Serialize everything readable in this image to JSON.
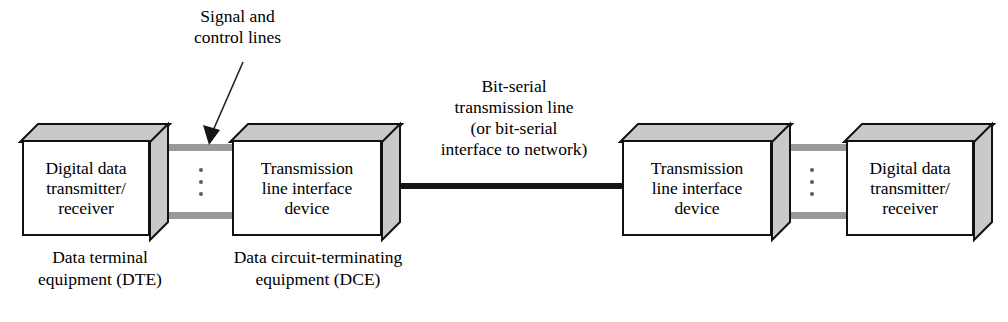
{
  "diagram": {
    "colors": {
      "box_face": "#ffffff",
      "box_shade": "#c9c9c9",
      "outline": "#111111",
      "signal_line": "#9a9a9a",
      "serial_line": "#151515",
      "text": "#000000"
    }
  },
  "boxes": [
    {
      "id": "dte-left",
      "label": "Digital data\ntransmitter/\nreceiver"
    },
    {
      "id": "dce-left",
      "label": "Transmission\nline interface\ndevice"
    },
    {
      "id": "dce-right",
      "label": "Transmission\nline interface\ndevice"
    },
    {
      "id": "dte-right",
      "label": "Digital data\ntransmitter/\nreceiver"
    }
  ],
  "annotations": {
    "signal_control": "Signal and\ncontrol lines",
    "bit_serial": "Bit-serial\ntransmission line\n(or bit-serial\ninterface to network)"
  },
  "captions": {
    "dte": "Data terminal\nequipment (DTE)",
    "dce": "Data circuit-terminating\nequipment (DCE)"
  },
  "ellipsis": {
    "glyph": "⋮",
    "count": 3
  }
}
